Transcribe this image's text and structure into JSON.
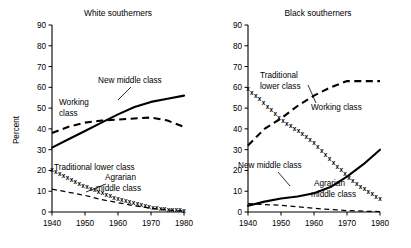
{
  "figure": {
    "ylabel": "Percent",
    "xlabel": ""
  },
  "chart_data": [
    {
      "type": "line",
      "title": "White southerners",
      "xlabel": "",
      "ylabel": "Percent",
      "xlim": [
        1940,
        1980
      ],
      "ylim": [
        0,
        90
      ],
      "yticks": [
        0,
        10,
        20,
        30,
        40,
        50,
        60,
        70,
        80,
        90
      ],
      "xticks": [
        1940,
        1950,
        1960,
        1970,
        1980
      ],
      "grid": false,
      "legend": "inline-labels",
      "x": [
        1940,
        1945,
        1950,
        1955,
        1960,
        1965,
        1970,
        1975,
        1980
      ],
      "series": [
        {
          "name": "New middle class",
          "style": "solid",
          "values": [
            31,
            35,
            39,
            43,
            47,
            50.5,
            53,
            54.5,
            56
          ]
        },
        {
          "name": "Working class",
          "style": "dashed",
          "values": [
            38,
            41,
            43,
            44,
            44.5,
            45,
            45.5,
            44,
            41
          ]
        },
        {
          "name": "Traditional lower class",
          "style": "x-marks",
          "values": [
            20,
            16,
            12,
            9,
            6,
            4,
            2,
            1,
            0.5
          ]
        },
        {
          "name": "Agrarian middle class",
          "style": "dashed-thin",
          "values": [
            11,
            9.5,
            8,
            6,
            4.5,
            3,
            1.8,
            1,
            0.5
          ]
        }
      ]
    },
    {
      "type": "line",
      "title": "Black southerners",
      "xlabel": "",
      "ylabel": "",
      "xlim": [
        1940,
        1980
      ],
      "ylim": [
        0,
        90
      ],
      "yticks": [
        0,
        10,
        20,
        30,
        40,
        50,
        60,
        70,
        80,
        90
      ],
      "xticks": [
        1940,
        1950,
        1960,
        1970,
        1980
      ],
      "grid": false,
      "legend": "inline-labels",
      "x": [
        1940,
        1945,
        1950,
        1955,
        1960,
        1965,
        1970,
        1975,
        1980
      ],
      "series": [
        {
          "name": "Traditional lower class",
          "style": "x-marks",
          "values": [
            59,
            52,
            44,
            39,
            33,
            25,
            17,
            11,
            6
          ]
        },
        {
          "name": "Working class",
          "style": "dashed",
          "values": [
            32,
            40,
            45,
            51,
            56,
            60,
            63,
            63,
            63
          ]
        },
        {
          "name": "New middle class",
          "style": "solid",
          "values": [
            3,
            5,
            6.5,
            7.5,
            9,
            12,
            17,
            23,
            30
          ]
        },
        {
          "name": "Agrarian middle class",
          "style": "dashed-thin",
          "values": [
            4,
            3.6,
            3.2,
            2.5,
            1.8,
            1.2,
            0.7,
            0.4,
            0.2
          ]
        }
      ]
    }
  ],
  "annotations": {
    "left": [
      {
        "text": "New middle class",
        "x": 98,
        "y": 83
      },
      {
        "text": "Working",
        "x": 59,
        "y": 105
      },
      {
        "text": "class",
        "x": 59,
        "y": 116
      },
      {
        "text": "Traditional lower class",
        "x": 54,
        "y": 170
      },
      {
        "text": "Agrarian",
        "x": 105,
        "y": 180
      },
      {
        "text": "middle class",
        "x": 96,
        "y": 191
      }
    ],
    "right": [
      {
        "text": "Traditional",
        "x": 54,
        "y": 78
      },
      {
        "text": "lower class",
        "x": 54,
        "y": 89
      },
      {
        "text": "Working class",
        "x": 105,
        "y": 110
      },
      {
        "text": "New middle class",
        "x": 32,
        "y": 168
      },
      {
        "text": "Agrarian",
        "x": 108,
        "y": 186
      },
      {
        "text": "middle class",
        "x": 105,
        "y": 197
      }
    ]
  }
}
